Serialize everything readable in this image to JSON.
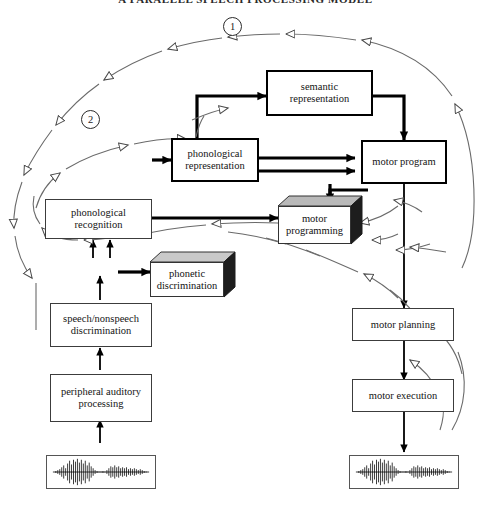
{
  "figure": {
    "title": "A PARALLEL SPEECH PROCESSING MODEL",
    "stage_numbers": [
      "1",
      "2"
    ]
  },
  "nodes": {
    "semantic_representation": {
      "label": "semantic representation",
      "style": "heavy-box"
    },
    "phonological_representation": {
      "label": "phonological representation",
      "style": "heavy-box"
    },
    "motor_program": {
      "label": "motor program",
      "style": "heavy-box"
    },
    "phonological_recognition": {
      "label": "phonological recognition",
      "style": "plain-box"
    },
    "motor_programming": {
      "label": "motor programming",
      "style": "3d-box-shaded"
    },
    "phonetic_discrimination": {
      "label": "phonetic discrimination",
      "style": "3d-box"
    },
    "speech_nonspeech_discrimination": {
      "label": "speech/nonspeech discrimination",
      "style": "plain-box"
    },
    "peripheral_auditory_processing": {
      "label": "peripheral auditory processing",
      "style": "plain-box"
    },
    "motor_planning": {
      "label": "motor planning",
      "style": "plain-box"
    },
    "motor_execution": {
      "label": "motor execution",
      "style": "plain-box"
    },
    "input_waveform": {
      "label": "speech input waveform",
      "style": "waveform-panel"
    },
    "output_waveform": {
      "label": "speech output waveform",
      "style": "waveform-panel"
    }
  },
  "colors": {
    "line": "#000000",
    "feedback_line": "#555555",
    "box_border": "#3c3c3c",
    "heavy_border": "#000000",
    "shade_fill": "#b9b9b9",
    "background": "#ffffff"
  },
  "legend": {
    "solid_arrow": "feedforward processing pathway",
    "open_arrow": "feedback / monitoring loop"
  }
}
